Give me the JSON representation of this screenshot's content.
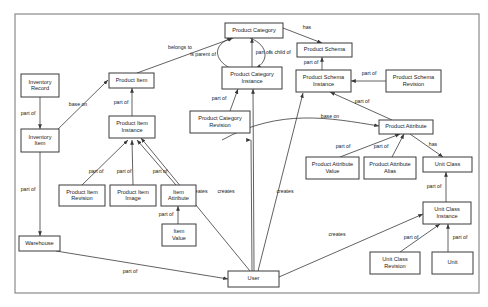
{
  "diagram": {
    "background_color": "#ffffff",
    "frame_color": "#8a8a8a",
    "node_fill": "#ffffff",
    "node_stroke": "#3a3a3a",
    "edge_color": "#3a3a3a",
    "text_color": "#1a1a1a",
    "frame": {
      "x": 15,
      "y": 14,
      "width": 464,
      "height": 279
    },
    "nodes": [
      {
        "id": "inventory-record",
        "label": "Inventory Record",
        "lines": [
          "Inventory",
          "Record"
        ],
        "x": 21,
        "y": 74,
        "w": 38,
        "h": 23
      },
      {
        "id": "inventory-item",
        "label": "Inventory Item",
        "lines": [
          "Inventory",
          "Item"
        ],
        "x": 21,
        "y": 129,
        "w": 38,
        "h": 23
      },
      {
        "id": "warehouse",
        "label": "Warehouse",
        "lines": [
          "Warehouse"
        ],
        "x": 19,
        "y": 236,
        "w": 41,
        "h": 15
      },
      {
        "id": "product-item",
        "label": "Product Item",
        "lines": [
          "Product Item"
        ],
        "x": 109,
        "y": 73,
        "w": 45,
        "h": 15
      },
      {
        "id": "product-item-instance",
        "label": "Product Item Instance",
        "lines": [
          "Product Item",
          "Instance"
        ],
        "x": 109,
        "y": 116,
        "w": 46,
        "h": 22
      },
      {
        "id": "product-item-revision",
        "label": "Product Item Revision",
        "lines": [
          "Product Item",
          "Revision"
        ],
        "x": 59,
        "y": 185,
        "w": 46,
        "h": 21
      },
      {
        "id": "product-item-image",
        "label": "Product Item Image",
        "lines": [
          "Product Item",
          "Image"
        ],
        "x": 110,
        "y": 185,
        "w": 46,
        "h": 21
      },
      {
        "id": "item-attribute",
        "label": "Item Attribute",
        "lines": [
          "Item",
          "Attribute"
        ],
        "x": 161,
        "y": 185,
        "w": 35,
        "h": 21
      },
      {
        "id": "item-value",
        "label": "Item Value",
        "lines": [
          "Item",
          "Value"
        ],
        "x": 162,
        "y": 224,
        "w": 34,
        "h": 22
      },
      {
        "id": "product-category",
        "label": "Product Category",
        "lines": [
          "Product Category"
        ],
        "x": 225,
        "y": 23,
        "w": 58,
        "h": 15
      },
      {
        "id": "product-category-instance",
        "label": "Product Category Instance",
        "lines": [
          "Product Category",
          "Instance"
        ],
        "x": 222,
        "y": 67,
        "w": 60,
        "h": 22
      },
      {
        "id": "product-category-revision",
        "label": "Product Category Revision",
        "lines": [
          "Product Category",
          "Revision"
        ],
        "x": 190,
        "y": 111,
        "w": 60,
        "h": 22
      },
      {
        "id": "product-schema",
        "label": "Product Schema",
        "lines": [
          "Product Schema"
        ],
        "x": 297,
        "y": 43,
        "w": 55,
        "h": 14
      },
      {
        "id": "product-schema-instance",
        "label": "Product Schema Instance",
        "lines": [
          "Product Schema",
          "Instance"
        ],
        "x": 296,
        "y": 70,
        "w": 55,
        "h": 22
      },
      {
        "id": "product-schema-revision",
        "label": "Product Schema Revision",
        "lines": [
          "Product Schema",
          "Revision"
        ],
        "x": 386,
        "y": 70,
        "w": 55,
        "h": 22
      },
      {
        "id": "product-attribute",
        "label": "Product Attribute",
        "lines": [
          "Product Attribute"
        ],
        "x": 379,
        "y": 120,
        "w": 54,
        "h": 14
      },
      {
        "id": "product-attribute-value",
        "label": "Product Attribute Value",
        "lines": [
          "Product Attribute",
          "Value"
        ],
        "x": 306,
        "y": 157,
        "w": 53,
        "h": 22
      },
      {
        "id": "product-attribute-alias",
        "label": "Product Attribute Alias",
        "lines": [
          "Product Attribute",
          "Alias"
        ],
        "x": 364,
        "y": 157,
        "w": 52,
        "h": 22
      },
      {
        "id": "unit-class",
        "label": "Unit Class",
        "lines": [
          "Unit Class"
        ],
        "x": 423,
        "y": 157,
        "w": 49,
        "h": 15
      },
      {
        "id": "unit-class-instance",
        "label": "Unit Class Instance",
        "lines": [
          "Unit Class",
          "Instance"
        ],
        "x": 423,
        "y": 202,
        "w": 48,
        "h": 22
      },
      {
        "id": "unit-class-revision",
        "label": "Unit Class Revision",
        "lines": [
          "Unit Class",
          "Revision"
        ],
        "x": 370,
        "y": 252,
        "w": 50,
        "h": 22
      },
      {
        "id": "unit",
        "label": "Unit",
        "lines": [
          "Unit"
        ],
        "x": 432,
        "y": 252,
        "w": 41,
        "h": 22
      },
      {
        "id": "user",
        "label": "User",
        "lines": [
          "User"
        ],
        "x": 228,
        "y": 271,
        "w": 51,
        "h": 16
      }
    ],
    "edges": [
      {
        "id": "inventory-record-to-inventory-item",
        "label": "part of",
        "from": "inventory-record",
        "to": "inventory-item",
        "path": "M 40 97 L 40 129",
        "label_x": 28,
        "label_y": 114
      },
      {
        "id": "inventory-item-to-product-item",
        "label": "base on",
        "from": "inventory-item",
        "to": "product-item",
        "path": "M 52 135 L 108 80",
        "label_x": 78,
        "label_y": 105
      },
      {
        "id": "inventory-item-to-warehouse",
        "label": "part of",
        "from": "inventory-item",
        "to": "warehouse",
        "path": "M 40 152 L 40 236",
        "label_x": 28,
        "label_y": 190
      },
      {
        "id": "product-item-to-product-category",
        "label": "belongs to",
        "from": "product-item",
        "to": "product-category",
        "path": "M 137 73 L 233 38",
        "label_x": 180,
        "label_y": 48
      },
      {
        "id": "product-item-instance-to-product-item",
        "label": "part of",
        "from": "product-item-instance",
        "to": "product-item",
        "path": "M 132 116 L 132 88",
        "label_x": 121,
        "label_y": 103
      },
      {
        "id": "product-item-instance-to-product-item-revision",
        "label": "part of",
        "from": "product-item-revision",
        "to": "product-item-instance",
        "path": "M 82 185 L 128 140",
        "label_x": 96,
        "label_y": 172
      },
      {
        "id": "product-item-image-to-product-item-instance",
        "label": "part of",
        "from": "product-item-image",
        "to": "product-item-instance",
        "path": "M 133 185 L 132 140",
        "label_x": 124,
        "label_y": 172
      },
      {
        "id": "item-attribute-to-product-item-instance",
        "label": "part of",
        "from": "item-attribute",
        "to": "product-item-instance",
        "path": "M 176 185 L 137 140",
        "label_x": 160,
        "label_y": 172
      },
      {
        "id": "item-value-to-item-attribute",
        "label": "part of",
        "from": "item-value",
        "to": "item-attribute",
        "path": "M 178 224 L 178 206",
        "label_x": 166,
        "label_y": 215
      },
      {
        "id": "product-category-instance-to-product-category",
        "label": "part of",
        "from": "product-category-instance",
        "to": "product-category",
        "path": "M 252 67 L 252 38",
        "label_x": 263,
        "label_y": 53
      },
      {
        "id": "product-category-is-parent-of",
        "label": "is parent of",
        "from": "product-category-instance",
        "to": "product-category",
        "path": "M 230 68 C 214 60 212 44 232 38",
        "label_x": 203,
        "label_y": 55
      },
      {
        "id": "product-category-is-child-of",
        "label": "is child of",
        "from": "product-category",
        "to": "product-category-instance",
        "path": "M 250 38 C 270 46 268 62 256 68",
        "label_x": 280,
        "label_y": 53
      },
      {
        "id": "product-category-revision-to-instance",
        "label": "part of",
        "from": "product-category-revision",
        "to": "product-category-instance",
        "path": "M 230 111 L 238 89",
        "label_x": 219,
        "label_y": 99
      },
      {
        "id": "product-category-to-product-schema",
        "label": "has",
        "from": "product-category",
        "to": "product-schema",
        "path": "M 283 28 L 322 43",
        "label_x": 307,
        "label_y": 28
      },
      {
        "id": "product-schema-instance-to-product-schema",
        "label": "part of",
        "from": "product-schema-instance",
        "to": "product-schema",
        "path": "M 322 70 L 322 57",
        "label_x": 311,
        "label_y": 63
      },
      {
        "id": "product-schema-revision-to-instance",
        "label": "part of",
        "from": "product-schema-revision",
        "to": "product-schema-instance",
        "path": "M 386 81 L 351 81",
        "label_x": 369,
        "label_y": 74
      },
      {
        "id": "product-attribute-to-schema-instance",
        "label": "part of",
        "from": "product-attribute",
        "to": "product-schema-instance",
        "path": "M 392 120 L 330 92",
        "label_x": 362,
        "label_y": 102
      },
      {
        "id": "product-category-instance-base-on-attribute",
        "label": "base on",
        "from": "product-category-instance",
        "to": "product-attribute",
        "path": "M 222 140 C 280 108 330 118 379 126",
        "label_x": 330,
        "label_y": 117
      },
      {
        "id": "product-attribute-value-to-attribute",
        "label": "part of",
        "from": "product-attribute-value",
        "to": "product-attribute",
        "path": "M 340 157 L 400 134",
        "label_x": 343,
        "label_y": 147
      },
      {
        "id": "product-attribute-alias-to-attribute",
        "label": "part of",
        "from": "product-attribute-alias",
        "to": "product-attribute",
        "path": "M 392 157 L 404 134",
        "label_x": 381,
        "label_y": 147
      },
      {
        "id": "product-attribute-has-unit-class",
        "label": "has",
        "from": "product-attribute",
        "to": "unit-class",
        "path": "M 410 134 L 443 157",
        "label_x": 433,
        "label_y": 145
      },
      {
        "id": "unit-class-instance-to-unit-class",
        "label": "part of",
        "from": "unit-class-instance",
        "to": "unit-class",
        "path": "M 446 202 L 446 172",
        "label_x": 434,
        "label_y": 187
      },
      {
        "id": "unit-class-revision-to-instance",
        "label": "part of",
        "from": "unit-class-revision",
        "to": "unit-class-instance",
        "path": "M 400 252 L 440 224",
        "label_x": 411,
        "label_y": 238
      },
      {
        "id": "unit-to-unit-class-instance",
        "label": "part of",
        "from": "unit",
        "to": "unit-class-instance",
        "path": "M 448 252 L 448 224",
        "label_x": 460,
        "label_y": 238
      },
      {
        "id": "warehouse-to-user",
        "label": "part of",
        "from": "warehouse",
        "to": "user",
        "path": "M 56 251 L 228 279",
        "label_x": 130,
        "label_y": 272
      },
      {
        "id": "user-creates-product-item-instance",
        "label": "creates",
        "from": "user",
        "to": "product-item-instance",
        "path": "M 250 271 L 141 138",
        "label_x": 173,
        "label_y": 192
      },
      {
        "id": "user-creates-item-attribute",
        "label": "creates",
        "from": "user",
        "to": "item-attribute",
        "path": "M 252 271 L 251 140 L 251 140",
        "label_x": 199,
        "label_y": 192
      },
      {
        "id": "user-creates-product-category-instance",
        "label": "creates",
        "from": "user",
        "to": "product-category-instance",
        "path": "M 254 271 L 253 89",
        "label_x": 226,
        "label_y": 192
      },
      {
        "id": "user-creates-product-schema-instance",
        "label": "creates",
        "from": "user",
        "to": "product-schema-instance",
        "path": "M 258 271 L 303 93",
        "label_x": 285,
        "label_y": 192
      },
      {
        "id": "user-creates-unit-class-instance",
        "label": "creates",
        "from": "user",
        "to": "unit-class-instance",
        "path": "M 279 277 L 423 214",
        "label_x": 337,
        "label_y": 235
      }
    ]
  }
}
